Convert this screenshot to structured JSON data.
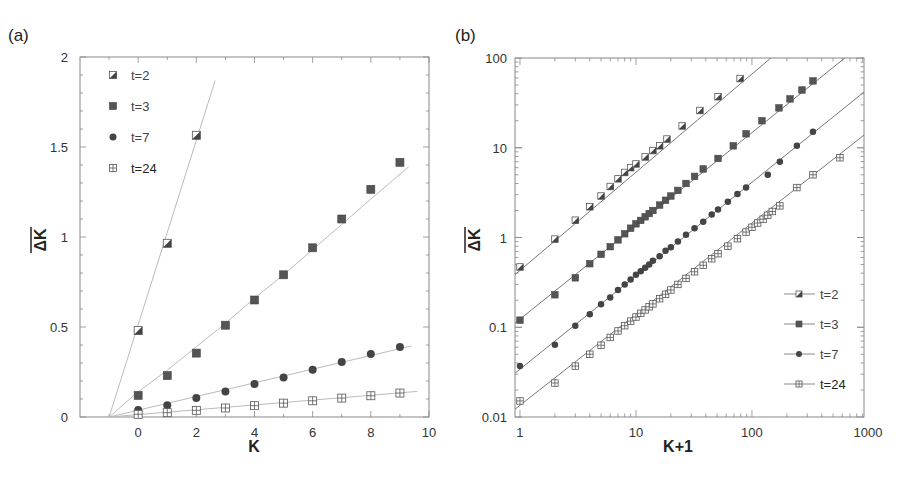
{
  "chart_data": [
    {
      "panel": "(a)",
      "type": "scatter",
      "title": "",
      "xlabel": "K",
      "ylabel": "ΔK (overlined)",
      "xlim": [
        -2,
        10
      ],
      "ylim": [
        0,
        2
      ],
      "xscale": "linear",
      "yscale": "linear",
      "xticks": [
        0,
        2,
        4,
        6,
        8,
        10
      ],
      "xtick_labels": [
        "0",
        "2",
        "4",
        "6",
        "8",
        "10"
      ],
      "yticks": [
        0,
        0.5,
        1,
        1.5,
        2
      ],
      "ytick_labels": [
        "0",
        "0.5",
        "1",
        "1.5",
        "2"
      ],
      "grid": false,
      "legend_position": "top-left",
      "series": [
        {
          "name": "t=2",
          "marker": "half-filled-square",
          "x": [
            0,
            1,
            2
          ],
          "y": [
            0.48,
            0.965,
            1.565
          ],
          "fit": {
            "x": [
              -1,
              2.65
            ],
            "y": [
              0,
              1.87
            ]
          }
        },
        {
          "name": "t=3",
          "marker": "filled-square",
          "x": [
            0,
            1,
            2,
            3,
            4,
            5,
            6,
            7,
            8,
            9
          ],
          "y": [
            0.12,
            0.23,
            0.355,
            0.51,
            0.65,
            0.79,
            0.94,
            1.1,
            1.265,
            1.415
          ],
          "fit": {
            "x": [
              -1,
              0,
              1,
              2,
              3,
              4,
              5,
              6,
              7,
              8,
              9.3
            ],
            "y": [
              0,
              0.14,
              0.26,
              0.39,
              0.52,
              0.66,
              0.79,
              0.93,
              1.07,
              1.21,
              1.39
            ]
          }
        },
        {
          "name": "t=7",
          "marker": "filled-circle",
          "x": [
            0,
            1,
            2,
            3,
            4,
            5,
            6,
            7,
            8,
            9
          ],
          "y": [
            0.039,
            0.065,
            0.105,
            0.142,
            0.183,
            0.22,
            0.262,
            0.306,
            0.35,
            0.389
          ],
          "fit": {
            "x": [
              -1,
              9.4
            ],
            "y": [
              0,
              0.395
            ]
          }
        },
        {
          "name": "t=24",
          "marker": "crossed-square",
          "x": [
            0,
            1,
            2,
            3,
            4,
            5,
            6,
            7,
            8,
            9
          ],
          "y": [
            0.015,
            0.024,
            0.037,
            0.05,
            0.063,
            0.077,
            0.09,
            0.105,
            0.118,
            0.133
          ],
          "fit": {
            "x": [
              -1,
              9.6
            ],
            "y": [
              0,
              0.142
            ]
          }
        }
      ]
    },
    {
      "panel": "(b)",
      "type": "scatter",
      "title": "",
      "xlabel": "K+1",
      "ylabel": "ΔK (overlined)",
      "xlim": [
        0.906,
        925
      ],
      "ylim": [
        0.01,
        100
      ],
      "xscale": "log",
      "yscale": "log",
      "xticks": [
        1,
        10,
        100,
        1000
      ],
      "xtick_labels": [
        "1",
        "10",
        "100",
        "1000"
      ],
      "yticks": [
        0.01,
        0.1,
        1,
        10,
        100
      ],
      "ytick_labels": [
        "0.01",
        "0.1",
        "1",
        "10",
        "100"
      ],
      "grid": false,
      "legend_position": "bottom-right",
      "series": [
        {
          "name": "t=2",
          "marker": "half-filled-square",
          "x": [
            1,
            2,
            3,
            4,
            5,
            6,
            7,
            8,
            9,
            10,
            12,
            14,
            16,
            18.5,
            25,
            35.6,
            51,
            79
          ],
          "y": [
            0.47,
            0.96,
            1.56,
            2.2,
            2.9,
            3.7,
            4.5,
            5.3,
            6.0,
            6.6,
            7.9,
            9.3,
            10.5,
            12.5,
            17.5,
            26,
            37,
            59
          ],
          "fit": {
            "a": 0.43,
            "b": 1.094
          }
        },
        {
          "name": "t=3",
          "marker": "filled-square",
          "x": [
            1,
            2,
            3,
            4,
            5,
            6,
            7,
            8,
            9,
            10,
            11,
            12,
            13,
            14,
            16,
            18,
            20,
            23,
            27,
            32,
            38,
            51,
            69,
            89,
            122,
            171,
            213,
            270,
            336
          ],
          "y": [
            0.12,
            0.23,
            0.355,
            0.51,
            0.65,
            0.79,
            0.94,
            1.1,
            1.27,
            1.42,
            1.55,
            1.7,
            1.85,
            2.0,
            2.3,
            2.6,
            2.9,
            3.35,
            4.0,
            4.8,
            5.8,
            7.6,
            10.5,
            14.3,
            20,
            27.8,
            35,
            44,
            55.5
          ],
          "fit": {
            "a": 0.123,
            "b": 1.039
          }
        },
        {
          "name": "t=7",
          "marker": "filled-circle",
          "x": [
            1,
            2,
            3,
            4,
            5,
            6,
            7,
            8,
            9,
            10,
            11,
            12,
            13,
            14,
            16,
            18,
            20,
            23,
            27,
            32,
            38,
            45,
            51,
            62,
            75,
            89,
            137,
            174,
            244,
            336
          ],
          "y": [
            0.037,
            0.064,
            0.104,
            0.14,
            0.18,
            0.215,
            0.26,
            0.3,
            0.34,
            0.385,
            0.42,
            0.46,
            0.5,
            0.55,
            0.62,
            0.71,
            0.78,
            0.9,
            1.07,
            1.27,
            1.5,
            1.8,
            2.05,
            2.5,
            3.05,
            3.6,
            5.0,
            7.0,
            10.5,
            15.1
          ],
          "fit": {
            "a": 0.0341,
            "b": 1.041
          }
        },
        {
          "name": "t=24",
          "marker": "crossed-square",
          "x": [
            1,
            2,
            3,
            4,
            5,
            6,
            7,
            8,
            9,
            10,
            11,
            12,
            13,
            14,
            16,
            18,
            20,
            23,
            27,
            32,
            38,
            45,
            51,
            62,
            75,
            89,
            100,
            112,
            125,
            137,
            150,
            174,
            244,
            336,
            574
          ],
          "y": [
            0.0151,
            0.0239,
            0.0369,
            0.05,
            0.063,
            0.077,
            0.091,
            0.104,
            0.117,
            0.13,
            0.143,
            0.156,
            0.169,
            0.182,
            0.208,
            0.233,
            0.26,
            0.3,
            0.35,
            0.415,
            0.49,
            0.58,
            0.66,
            0.8,
            0.97,
            1.15,
            1.3,
            1.45,
            1.6,
            1.77,
            1.95,
            2.25,
            3.6,
            5.0,
            7.74
          ],
          "fit": {
            "a": 0.0135,
            "b": 1.015
          }
        }
      ]
    }
  ]
}
